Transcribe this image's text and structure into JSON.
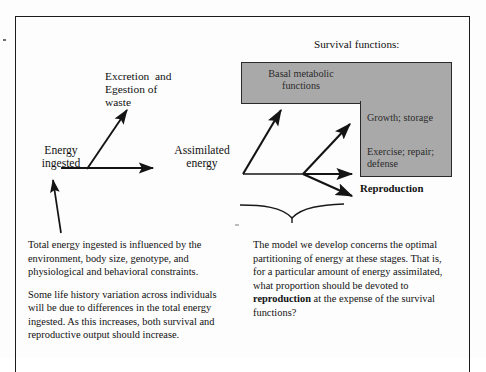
{
  "figure": {
    "title_right": "Survival functions:",
    "nodes": {
      "energy_ingested": "Energy\ningested",
      "excretion": "Excretion  and\nEgestion of\nwaste",
      "assimilated": "Assimilated\nenergy",
      "basal": "Basal metabolic\nfunctions",
      "growth": "Growth; storage",
      "exercise": "Exercise; repair;\ndefense",
      "reproduction": "Reproduction"
    },
    "colors": {
      "gray_fill": "#a9a9a9",
      "stroke": "#1b1b1b",
      "page_background": "#fdfdfd",
      "text": "#111111"
    },
    "notes": {
      "left": [
        "Total energy ingested is influenced by the environment, body size, genotype, and physiological and behavioral constraints.",
        "Some life history variation across individuals will be due to differences in the total energy ingested.  As this increases, both survival and reproductive output should increase."
      ],
      "right_part1": "The model we develop concerns the optimal  partitioning of energy at these stages.  That is,  for a particular amount of energy assimilated, what proportion should be devoted to ",
      "right_bold": "reproduction",
      "right_part2": " at the expense of the survival functions?"
    }
  }
}
